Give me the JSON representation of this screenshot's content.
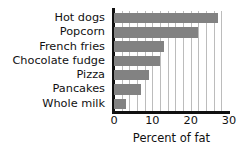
{
  "chart_data": {
    "type": "bar",
    "orientation": "horizontal",
    "title": "",
    "xlabel": "Percent of fat",
    "ylabel": "",
    "categories": [
      "Hot dogs",
      "Popcorn",
      "French fries",
      "Chocolate fudge",
      "Pizza",
      "Pancakes",
      "Whole milk"
    ],
    "values": [
      27,
      22,
      13,
      12,
      9,
      7,
      3
    ],
    "xlim": [
      0,
      30
    ],
    "xticks": [
      0,
      10,
      20,
      30
    ],
    "xtick_labels": [
      "0",
      "10",
      "20",
      "30"
    ],
    "gridline_interval": 2,
    "grid": true,
    "legend": null,
    "bar_color": "#828282",
    "grid_color": "#bcbcbc",
    "axis_color": "#111111",
    "background": "#ffffff"
  }
}
